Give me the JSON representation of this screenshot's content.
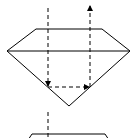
{
  "diagram": {
    "colors": {
      "stroke": "#000000",
      "background": "#ffffff"
    },
    "diamond": {
      "table_left": [
        36,
        29
      ],
      "table_right": [
        102,
        29
      ],
      "girdle_left": [
        7,
        51
      ],
      "girdle_right": [
        130,
        51
      ],
      "culet": [
        69,
        106
      ]
    },
    "ray": {
      "incoming": {
        "from": [
          48,
          8
        ],
        "to": [
          48,
          87
        ]
      },
      "internal": {
        "from": [
          48,
          87
        ],
        "to": [
          90,
          87
        ]
      },
      "outgoing": {
        "from": [
          90,
          87
        ],
        "to": [
          90,
          5
        ]
      }
    },
    "second_diamond": {
      "table_left": [
        32,
        134
      ],
      "table_right": [
        105,
        134
      ],
      "incoming_ray": {
        "from": [
          48,
          112
        ],
        "to": [
          48,
          138
        ]
      }
    }
  }
}
